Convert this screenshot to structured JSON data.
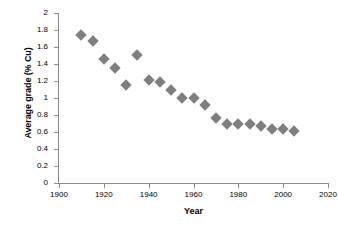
{
  "chart_data": {
    "type": "scatter",
    "title": "",
    "xlabel": "Year",
    "ylabel": "Average grade (% Cu)",
    "xlim": [
      1900,
      2020
    ],
    "ylim": [
      0,
      2
    ],
    "xticks": [
      1900,
      1920,
      1940,
      1960,
      1980,
      2000,
      2020
    ],
    "yticks": [
      0,
      0.2,
      0.4,
      0.6,
      0.8,
      1,
      1.2,
      1.4,
      1.6,
      1.8,
      2
    ],
    "xtick_labels": [
      "1900",
      "1920",
      "1940",
      "1960",
      "1980",
      "2000",
      "2020"
    ],
    "ytick_labels": [
      "0",
      "0.2",
      "0.4",
      "0.6",
      "0.8",
      "1",
      "1.2",
      "1.4",
      "1.6",
      "1.8",
      "2"
    ],
    "grid": false,
    "legend": false,
    "marker_shape": "diamond",
    "marker_color": "#7f7f7f",
    "axis_color": "#8c8c8c",
    "series": [
      {
        "name": "Average grade (% Cu)",
        "x": [
          1910,
          1915,
          1920,
          1925,
          1930,
          1935,
          1940,
          1945,
          1950,
          1955,
          1960,
          1965,
          1970,
          1975,
          1980,
          1985,
          1990,
          1995,
          2000,
          2005
        ],
        "y": [
          1.74,
          1.67,
          1.46,
          1.35,
          1.15,
          1.51,
          1.21,
          1.19,
          1.09,
          1.0,
          1.0,
          0.92,
          0.76,
          0.69,
          0.69,
          0.69,
          0.67,
          0.64,
          0.64,
          0.61
        ]
      }
    ]
  }
}
